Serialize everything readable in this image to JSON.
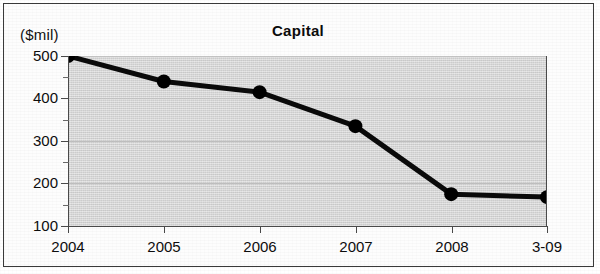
{
  "chart_data": {
    "type": "line",
    "title": "Capital",
    "unit_label": "($mil)",
    "xlabel": "",
    "ylabel": "",
    "categories": [
      "2004",
      "2005",
      "2006",
      "2007",
      "2008",
      "3-09"
    ],
    "values": [
      500,
      440,
      415,
      335,
      175,
      168
    ],
    "series": [
      {
        "name": "Capital",
        "values": [
          500,
          440,
          415,
          335,
          175,
          168
        ]
      }
    ],
    "ylim": [
      100,
      500
    ],
    "y_ticks": [
      100,
      200,
      300,
      400,
      500
    ],
    "y_tick_labels": [
      "100",
      "200",
      "300",
      "400",
      "500"
    ],
    "y_minor_ticks": [
      150,
      250,
      350,
      450
    ],
    "grid": true,
    "legend": "none",
    "marker": "filled-circle",
    "line_color": "#000000",
    "marker_color": "#000000",
    "plot_background": "#d6d6d6",
    "gridline_color": "#c2c2c2",
    "axis_color": "#4a4a4a"
  },
  "axis": {
    "y_labels": [
      "500",
      "400",
      "300",
      "200",
      "100"
    ],
    "x_labels": [
      "2004",
      "2005",
      "2006",
      "2007",
      "2008",
      "3-09"
    ]
  }
}
